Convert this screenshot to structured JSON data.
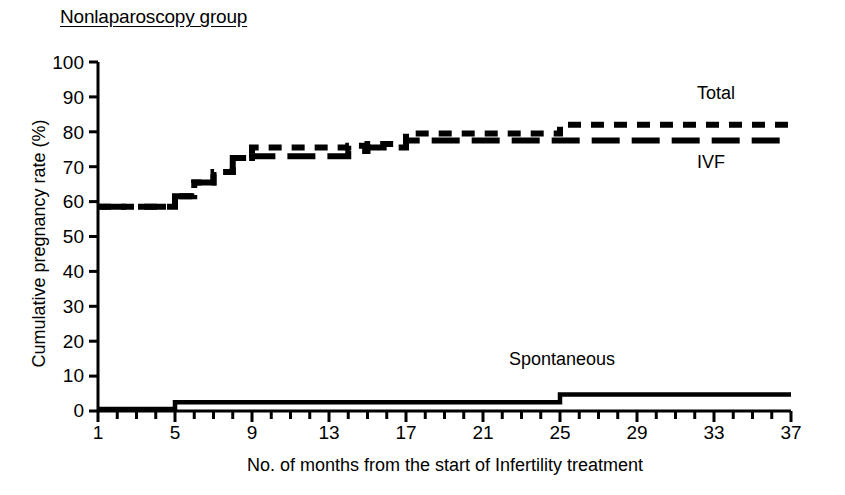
{
  "chart_data": {
    "type": "line",
    "title": "Nonlaparoscopy group",
    "xlabel": "No. of months from the start of Infertility treatment",
    "ylabel": "Cumulative pregnancy rate (%)",
    "xlim": [
      1,
      37
    ],
    "ylim": [
      0,
      100
    ],
    "grid": false,
    "legend_position": "inline-annotations",
    "x_tick_labels": [
      "1",
      "5",
      "9",
      "13",
      "17",
      "21",
      "25",
      "29",
      "33",
      "37"
    ],
    "x_tick_values": [
      1,
      5,
      9,
      13,
      17,
      21,
      25,
      29,
      33,
      37
    ],
    "x_minor_tick_step": 1,
    "y_tick_labels": [
      "0",
      "10",
      "20",
      "30",
      "40",
      "50",
      "60",
      "70",
      "80",
      "90",
      "100"
    ],
    "y_tick_values": [
      0,
      10,
      20,
      30,
      40,
      50,
      60,
      70,
      80,
      90,
      100
    ],
    "x": [
      1,
      2,
      3,
      4,
      5,
      6,
      7,
      8,
      9,
      10,
      11,
      12,
      13,
      14,
      15,
      16,
      17,
      18,
      19,
      20,
      21,
      22,
      23,
      24,
      25,
      26,
      27,
      28,
      29,
      30,
      31,
      32,
      33,
      34,
      35,
      36
    ],
    "series": [
      {
        "name": "Total",
        "label": "Total",
        "line_style": "short-dashed",
        "color": "#000000",
        "values": [
          58.5,
          58.5,
          58.5,
          58.5,
          61.5,
          65.5,
          68.5,
          72.5,
          75.5,
          75.5,
          75.5,
          75.5,
          75.5,
          76.0,
          76.5,
          76.5,
          79.5,
          79.5,
          79.5,
          79.5,
          79.5,
          79.5,
          79.5,
          79.5,
          82.0,
          82.0,
          82.0,
          82.0,
          82.0,
          82.0,
          82.0,
          82.0,
          82.0,
          82.0,
          82.0,
          82.0
        ]
      },
      {
        "name": "IVF",
        "label": "IVF",
        "line_style": "long-dashed",
        "color": "#000000",
        "values": [
          58.5,
          58.5,
          58.5,
          58.5,
          61.5,
          65.5,
          68.5,
          72.5,
          73.0,
          73.0,
          73.0,
          73.0,
          73.0,
          74.5,
          75.5,
          75.5,
          77.5,
          77.5,
          77.5,
          77.5,
          77.5,
          77.5,
          77.5,
          77.5,
          77.5,
          77.5,
          77.5,
          77.5,
          77.5,
          77.5,
          77.5,
          77.5,
          77.5,
          77.5,
          77.5,
          77.5
        ]
      },
      {
        "name": "Spontaneous",
        "label": "Spontaneous",
        "line_style": "solid",
        "color": "#000000",
        "values": [
          0.6,
          0.6,
          0.6,
          0.6,
          2.5,
          2.5,
          2.5,
          2.5,
          2.5,
          2.5,
          2.5,
          2.5,
          2.5,
          2.5,
          2.5,
          2.5,
          2.5,
          2.5,
          2.5,
          2.5,
          2.5,
          2.5,
          2.5,
          2.5,
          4.7,
          4.7,
          4.7,
          4.7,
          4.7,
          4.7,
          4.7,
          4.7,
          4.7,
          4.7,
          4.7,
          4.7
        ]
      }
    ],
    "annotations": [
      {
        "text": "Total",
        "series": "Total"
      },
      {
        "text": "IVF",
        "series": "IVF"
      },
      {
        "text": "Spontaneous",
        "series": "Spontaneous"
      }
    ]
  }
}
